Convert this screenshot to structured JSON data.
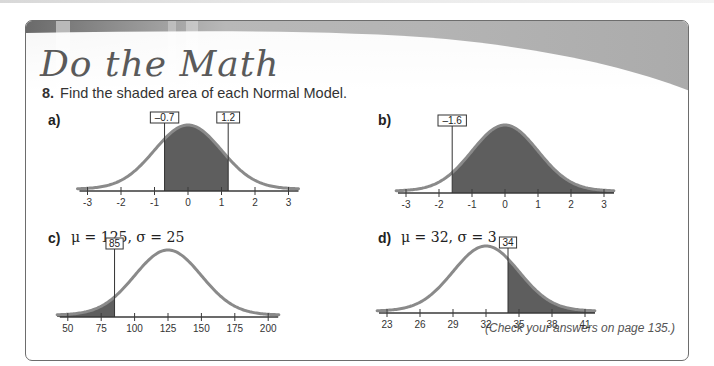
{
  "header": {
    "title": "Do the Math"
  },
  "problem": {
    "number": "8.",
    "text": "Find the shaded area of each Normal Model."
  },
  "parts": [
    {
      "label": "a)",
      "params": ""
    },
    {
      "label": "b)",
      "params": ""
    },
    {
      "label": "c)",
      "params": "μ = 125, σ = 25"
    },
    {
      "label": "d)",
      "params": "μ = 32, σ = 3"
    }
  ],
  "footer": {
    "note": "(Check your answers on page 135.)"
  },
  "colors": {
    "curve": "#8a8a8a",
    "shade": "#5e5e5e",
    "axis": "#3a3a3a",
    "frame": "#6d6d6d"
  },
  "chart_data": [
    {
      "id": "a",
      "type": "area",
      "title": "a)",
      "distribution": "Normal",
      "mean": 0,
      "sd": 1,
      "tick_labels": [
        "-3",
        "-2",
        "-1",
        "0",
        "1",
        "2",
        "3"
      ],
      "tick_values": [
        -3,
        -2,
        -1,
        0,
        1,
        2,
        3
      ],
      "shaded_region": {
        "from": -0.7,
        "to": 1.2
      },
      "cutoff_labels": [
        "-0.7",
        "1.2"
      ],
      "cutoff_values": [
        -0.7,
        1.2
      ],
      "xlim": [
        -3.3,
        3.3
      ],
      "grid": false,
      "layout": {
        "x0": 188,
        "pxPerUnit": 33.5,
        "axisY": 191,
        "peakY": 127,
        "labelBoxY": 112
      }
    },
    {
      "id": "b",
      "type": "area",
      "title": "b)",
      "distribution": "Normal",
      "mean": 0,
      "sd": 1,
      "tick_labels": [
        "-3",
        "-2",
        "-1",
        "0",
        "1",
        "2",
        "3"
      ],
      "tick_values": [
        -3,
        -2,
        -1,
        0,
        1,
        2,
        3
      ],
      "shaded_region": {
        "from": -1.6,
        "to": 3.3
      },
      "cutoff_labels": [
        "-1.6"
      ],
      "cutoff_values": [
        -1.6
      ],
      "xlim": [
        -3.3,
        3.3
      ],
      "grid": false,
      "layout": {
        "x0": 505,
        "pxPerUnit": 33,
        "axisY": 193,
        "peakY": 127,
        "labelBoxY": 115
      }
    },
    {
      "id": "c",
      "type": "area",
      "title": "c) μ = 125, σ = 25",
      "distribution": "Normal",
      "mean": 125,
      "sd": 25,
      "tick_labels": [
        "50",
        "75",
        "100",
        "125",
        "150",
        "175",
        "200"
      ],
      "tick_values": [
        50,
        75,
        100,
        125,
        150,
        175,
        200
      ],
      "shaded_region": {
        "from": 42,
        "to": 85
      },
      "cutoff_labels": [
        "85"
      ],
      "cutoff_values": [
        85
      ],
      "xlim": [
        42,
        208
      ],
      "grid": false,
      "layout": {
        "x0": 168,
        "pxPerUnit": 1.336,
        "axisY": 317,
        "peakY": 252,
        "labelBoxY": 238
      }
    },
    {
      "id": "d",
      "type": "area",
      "title": "d) μ = 32, σ = 3",
      "distribution": "Normal",
      "mean": 32,
      "sd": 3,
      "tick_labels": [
        "23",
        "26",
        "29",
        "32",
        "35",
        "38",
        "41"
      ],
      "tick_values": [
        23,
        26,
        29,
        32,
        35,
        38,
        41
      ],
      "shaded_region": {
        "from": 34,
        "to": 41.9
      },
      "cutoff_labels": [
        "34"
      ],
      "cutoff_values": [
        34
      ],
      "xlim": [
        22.1,
        41.9
      ],
      "grid": false,
      "layout": {
        "x0": 486,
        "pxPerUnit": 11,
        "axisY": 313,
        "peakY": 248,
        "labelBoxY": 237
      }
    }
  ]
}
